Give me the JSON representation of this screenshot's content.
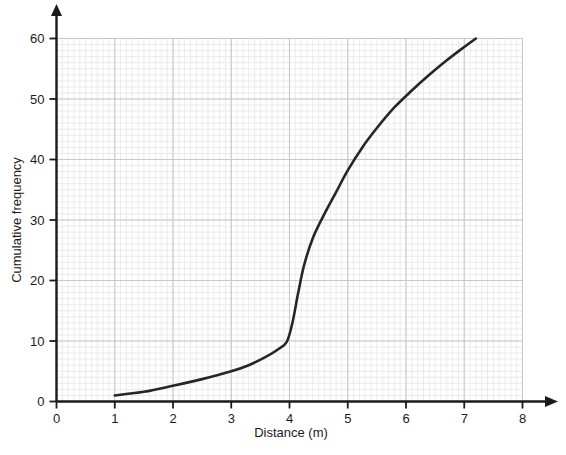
{
  "chart_data": {
    "type": "line",
    "title": "",
    "subtitle": "",
    "xlabel": "Distance (m)",
    "ylabel": "Cumulative frequency",
    "xlim": [
      0,
      8
    ],
    "ylim": [
      0,
      60
    ],
    "xticks": [
      "0",
      "1",
      "2",
      "3",
      "4",
      "5",
      "6",
      "7",
      "8"
    ],
    "xtick_values": [
      0,
      1,
      2,
      3,
      4,
      5,
      6,
      7,
      8
    ],
    "yticks": [
      "0",
      "10",
      "20",
      "30",
      "40",
      "50",
      "60"
    ],
    "ytick_values": [
      0,
      10,
      20,
      30,
      40,
      50,
      60
    ],
    "grid": true,
    "grid_minor": true,
    "grid_major_color": "#c8c8cc",
    "grid_minor_color": "#e6e6ea",
    "axis_color": "#1b1b1b",
    "legend": null,
    "legend_position": "none",
    "series": [
      {
        "name": "Cumulative frequency",
        "color": "#262626",
        "line_width": 2.6,
        "x": [
          1.0,
          1.5,
          2.0,
          2.5,
          3.0,
          3.3,
          3.6,
          3.8,
          3.95,
          4.05,
          4.15,
          4.25,
          4.4,
          4.6,
          4.8,
          5.0,
          5.25,
          5.5,
          5.8,
          6.1,
          6.4,
          6.7,
          7.0,
          7.2
        ],
        "y": [
          1.0,
          1.6,
          2.6,
          3.7,
          5.0,
          6.0,
          7.4,
          8.6,
          9.8,
          13.0,
          18.0,
          22.5,
          27.0,
          31.0,
          34.6,
          38.2,
          42.0,
          45.2,
          48.6,
          51.4,
          54.0,
          56.4,
          58.6,
          60.0
        ]
      }
    ]
  },
  "axes": {
    "x_axis_label": "Distance (m)",
    "y_axis_label": "Cumulative frequency",
    "x_arrow": true,
    "y_arrow": true
  },
  "caption": {
    "top_partial_text": ""
  }
}
